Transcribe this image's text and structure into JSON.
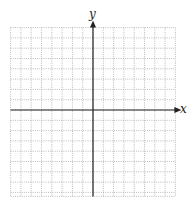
{
  "diagram": {
    "type": "coordinate-plane",
    "x_axis_label": "x",
    "y_axis_label": "y",
    "grid": {
      "columns_left_of_y_axis": 8,
      "columns_right_of_y_axis": 8,
      "rows_above_x_axis": 8,
      "rows_below_x_axis": 8,
      "line_style": "dotted",
      "line_color": "#aaaaaa"
    },
    "axis_color": "#222222",
    "arrows": [
      "positive-x",
      "positive-y"
    ]
  }
}
